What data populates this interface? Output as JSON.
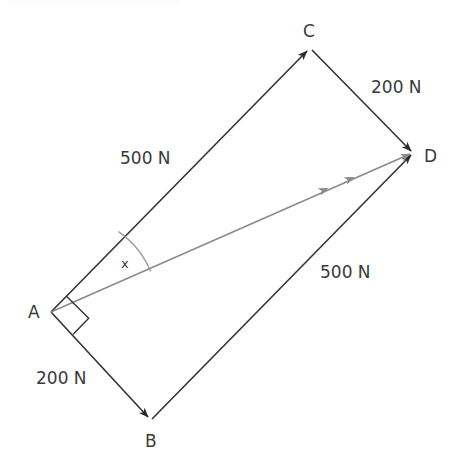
{
  "diagram": {
    "type": "vector-parallelogram",
    "stroke_color": "#333333",
    "resultant_color": "#8a8a8a",
    "arc_color": "#9a9a9a",
    "background": "#ffffff",
    "vertices": [
      {
        "id": "A",
        "label": "A",
        "x": 51,
        "y": 312,
        "label_x": 28,
        "label_y": 318
      },
      {
        "id": "B",
        "label": "B",
        "x": 150,
        "y": 420,
        "label_x": 145,
        "label_y": 447
      },
      {
        "id": "C",
        "label": "C",
        "x": 310,
        "y": 48,
        "label_x": 303,
        "label_y": 37
      },
      {
        "id": "D",
        "label": "D",
        "x": 413,
        "y": 153,
        "label_x": 424,
        "label_y": 162
      }
    ],
    "edges": [
      {
        "name": "edge-a-to-c",
        "from": "A",
        "to": "C",
        "force_label": "500 N",
        "label_x": 120,
        "label_y": 164,
        "arrow": true,
        "color": "#333333"
      },
      {
        "name": "edge-c-to-d",
        "from": "C",
        "to": "D",
        "force_label": "200 N",
        "label_x": 371,
        "label_y": 93,
        "arrow": true,
        "color": "#333333"
      },
      {
        "name": "edge-a-to-b",
        "from": "A",
        "to": "B",
        "force_label": "200 N",
        "label_x": 36,
        "label_y": 384,
        "arrow": true,
        "color": "#333333"
      },
      {
        "name": "edge-b-to-d",
        "from": "B",
        "to": "D",
        "force_label": "500 N",
        "label_x": 320,
        "label_y": 278,
        "arrow": true,
        "color": "#333333"
      }
    ],
    "resultant": {
      "name": "resultant-a-to-d",
      "from": "A",
      "to": "D",
      "double_arrow": true,
      "color": "#8a8a8a"
    },
    "angle": {
      "name": "angle-x",
      "label": "x",
      "at_vertex": "A",
      "between": [
        "A-C",
        "A-D"
      ],
      "label_x": 121,
      "label_y": 268
    },
    "right_angle": {
      "name": "right-angle-marker",
      "at_vertex": "A",
      "between": [
        "A-C",
        "A-B"
      ]
    }
  }
}
